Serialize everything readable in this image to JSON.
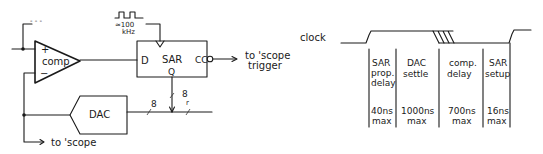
{
  "schematic": {
    "comparator": {
      "label": "comp",
      "plus": "+",
      "minus": "−"
    },
    "plus_input_stub": "- - -",
    "sar": {
      "label": "SAR",
      "d_pin": "D",
      "q_pin": "Q",
      "cc_pin": "CC"
    },
    "clock_freq": {
      "line1": "≈100",
      "line2": "kHz"
    },
    "dac": {
      "label": "DAC"
    },
    "bus_width_dac": "8",
    "bus_width_q": "8",
    "bus_width_q_sub": "r",
    "output_trigger": {
      "line1": "to 'scope",
      "line2": "trigger"
    },
    "output_scope": "to 'scope"
  },
  "timing": {
    "signal_label": "clock",
    "intervals": [
      {
        "name_lines": [
          "SAR",
          "prop.",
          "delay"
        ],
        "value": "40ns",
        "unit": "max"
      },
      {
        "name_lines": [
          "DAC",
          "settle"
        ],
        "value": "1000ns",
        "unit": "max"
      },
      {
        "name_lines": [
          "comp.",
          "delay"
        ],
        "value": "700ns",
        "unit": "max"
      },
      {
        "name_lines": [
          "SAR",
          "setup"
        ],
        "value": "16ns",
        "unit": "max"
      }
    ]
  }
}
